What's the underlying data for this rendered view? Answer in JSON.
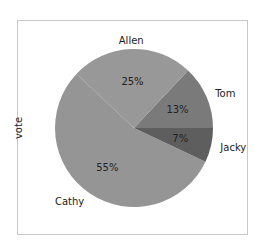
{
  "chart_data": {
    "type": "pie",
    "title": "",
    "ylabel": "vote",
    "xlabel": "",
    "start_angle_deg": 0,
    "direction": "counterclockwise",
    "slices": [
      {
        "label": "Tom",
        "value": 13,
        "pct_label": "13%",
        "color": "#7a7a7a"
      },
      {
        "label": "Allen",
        "value": 25,
        "pct_label": "25%",
        "color": "#989898"
      },
      {
        "label": "Cathy",
        "value": 55,
        "pct_label": "55%",
        "color": "#959595"
      },
      {
        "label": "Jacky",
        "value": 7,
        "pct_label": "7%",
        "color": "#5e5e5e"
      }
    ],
    "legend": "none"
  }
}
